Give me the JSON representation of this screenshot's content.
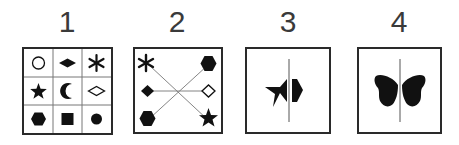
{
  "figure": {
    "panels": [
      {
        "label": "1",
        "description": "3x3 grid of shapes",
        "grid": [
          [
            "circle-outline",
            "diamond-filled-wide",
            "asterisk"
          ],
          [
            "star-filled",
            "crescent-moon",
            "diamond-outline-wide"
          ],
          [
            "hexagon-filled",
            "square-filled",
            "circle-filled"
          ]
        ]
      },
      {
        "label": "2",
        "description": "shapes connected by lines through center",
        "left": [
          "asterisk",
          "diamond-filled",
          "hexagon-filled"
        ],
        "right": [
          "hexagon-filled",
          "diamond-outline",
          "star-filled"
        ]
      },
      {
        "label": "3",
        "description": "half star and half hexagon mirrored across vertical line"
      },
      {
        "label": "4",
        "description": "butterfly symmetric across vertical line"
      }
    ],
    "colors": {
      "ink": "#111111",
      "border": "#2a2a2a",
      "line": "#777777",
      "label": "#3a3a3a"
    }
  }
}
